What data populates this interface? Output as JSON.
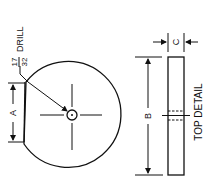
{
  "drawing": {
    "drill_callout": {
      "numerator": "17",
      "denominator": "32",
      "label": "DRILL"
    },
    "dimensions": {
      "a": "A",
      "b": "B",
      "c": "C"
    },
    "view_label": "TOP DETAIL",
    "colors": {
      "line": "#111111",
      "background": "#ffffff"
    }
  }
}
